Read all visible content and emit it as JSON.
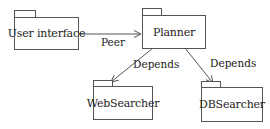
{
  "diagram": {
    "type": "UML package diagram",
    "nodes": [
      {
        "id": "user_interface",
        "label": "User interface"
      },
      {
        "id": "planner",
        "label": "Planner"
      },
      {
        "id": "websearcher",
        "label": "WebSearcher"
      },
      {
        "id": "dbsearcher",
        "label": "DBSearcher"
      }
    ],
    "edges": [
      {
        "from": "user_interface",
        "to": "planner",
        "label": "Peer",
        "style": "bidirectional"
      },
      {
        "from": "planner",
        "to": "websearcher",
        "label": "Depends",
        "style": "directed"
      },
      {
        "from": "planner",
        "to": "dbsearcher",
        "label": "Depends",
        "style": "directed"
      }
    ]
  },
  "colors": {
    "line": "#555555",
    "text": "#222222",
    "background": "#ffffff"
  }
}
